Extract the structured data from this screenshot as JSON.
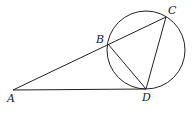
{
  "diagram": {
    "type": "geometry",
    "points": {
      "A": {
        "label": "A",
        "x": 13,
        "y": 90
      },
      "B": {
        "label": "B",
        "x": 108,
        "y": 44
      },
      "C": {
        "label": "C",
        "x": 166,
        "y": 17
      },
      "D": {
        "label": "D",
        "x": 146,
        "y": 89
      }
    },
    "circle": {
      "cx": 146,
      "cy": 50,
      "r": 39
    },
    "segments": [
      "AC",
      "AD",
      "BD",
      "CD"
    ],
    "colors": {
      "stroke": "#222222",
      "background": "#ffffff"
    }
  }
}
